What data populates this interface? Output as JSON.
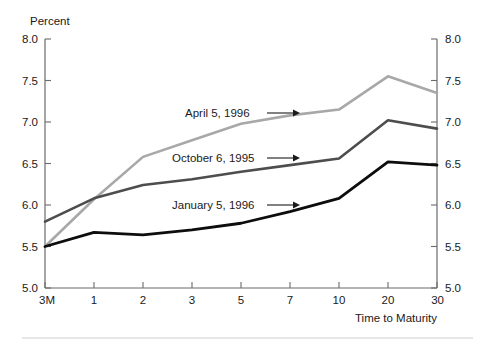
{
  "chart_data": {
    "type": "line",
    "title": "",
    "subtitle": "",
    "ylabel": "Percent",
    "xlabel": "Time to Maturity",
    "categories": [
      "3M",
      "1",
      "2",
      "3",
      "5",
      "7",
      "10",
      "20",
      "30"
    ],
    "ytick_labels": [
      "8.0",
      "7.5",
      "7.0",
      "6.5",
      "6.0",
      "5.5",
      "5.0"
    ],
    "ytick_values": [
      8.0,
      7.5,
      7.0,
      6.5,
      6.0,
      5.5,
      5.0
    ],
    "ylim": [
      5.0,
      8.0
    ],
    "grid": false,
    "legend_position": "inline-annotations",
    "right_axis": true,
    "right_ytick_labels": [
      "8.0",
      "7.5",
      "7.0",
      "6.5",
      "6.0",
      "5.5",
      "5.0"
    ],
    "series": [
      {
        "name": "April 5, 1996",
        "color": "#a8a8a8",
        "width": 2.6,
        "values": [
          5.5,
          6.07,
          6.58,
          6.78,
          6.98,
          7.08,
          7.15,
          7.55,
          7.35
        ]
      },
      {
        "name": "October 6, 1995",
        "color": "#4d4d4d",
        "width": 2.6,
        "values": [
          5.8,
          6.08,
          6.24,
          6.31,
          6.4,
          6.48,
          6.56,
          7.02,
          6.92
        ]
      },
      {
        "name": "January 5, 1996",
        "color": "#0d0d0d",
        "width": 2.8,
        "values": [
          5.5,
          5.67,
          5.64,
          5.7,
          5.78,
          5.92,
          6.08,
          6.52,
          6.48
        ]
      }
    ],
    "annotations": [
      {
        "text": "April 5, 1996",
        "label_x": 185,
        "label_y": 117,
        "arrow_from_x": 267,
        "arrow_to_x": 300,
        "arrow_y": 113
      },
      {
        "text": "October 6, 1995",
        "label_x": 172,
        "label_y": 162,
        "arrow_from_x": 267,
        "arrow_to_x": 300,
        "arrow_y": 158
      },
      {
        "text": "January 5, 1996",
        "label_x": 172,
        "label_y": 209,
        "arrow_from_x": 267,
        "arrow_to_x": 300,
        "arrow_y": 205
      }
    ]
  },
  "colors": {
    "background": "#ffffff",
    "axis": "#6b6b6b",
    "text": "#1a1a1a",
    "footer_rule": "#cfcfcf"
  }
}
